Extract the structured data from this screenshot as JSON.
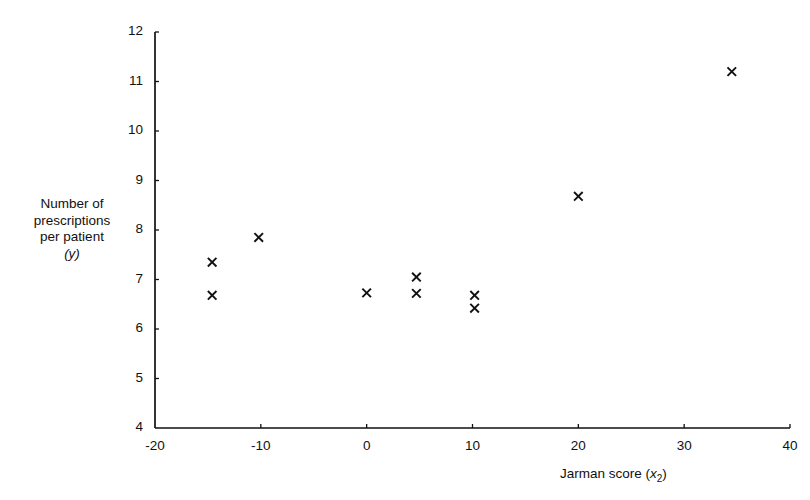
{
  "chart_data": {
    "type": "scatter",
    "title": "",
    "xlabel": "Jarman score (x2)",
    "xlabel_text": "Jarman score (",
    "xlabel_var": "x",
    "xlabel_sub": "2",
    "xlabel_close": ")",
    "ylabel_lines": [
      "Number of",
      "prescriptions",
      "per patient"
    ],
    "ylabel_var": "(y)",
    "xlim": [
      -20,
      40
    ],
    "ylim": [
      4,
      12
    ],
    "xticks": [
      -20,
      -10,
      0,
      10,
      20,
      30,
      40
    ],
    "xtick_labels": [
      "-20",
      "-10",
      "0",
      "10",
      "20",
      "30",
      "40"
    ],
    "yticks": [
      4,
      5,
      6,
      7,
      8,
      9,
      10,
      11,
      12
    ],
    "ytick_labels": [
      "4",
      "5",
      "6",
      "7",
      "8",
      "9",
      "10",
      "11",
      "12"
    ],
    "grid": false,
    "legend": null,
    "marker": "x",
    "marker_color": "#111111",
    "points": [
      {
        "x": -14.6,
        "y": 7.35
      },
      {
        "x": -14.6,
        "y": 6.68
      },
      {
        "x": -10.2,
        "y": 7.85
      },
      {
        "x": 0.0,
        "y": 6.73
      },
      {
        "x": 4.7,
        "y": 7.05
      },
      {
        "x": 4.7,
        "y": 6.72
      },
      {
        "x": 10.2,
        "y": 6.68
      },
      {
        "x": 10.2,
        "y": 6.42
      },
      {
        "x": 20.0,
        "y": 8.68
      },
      {
        "x": 34.5,
        "y": 11.2
      }
    ],
    "axis_color": "#111111"
  }
}
